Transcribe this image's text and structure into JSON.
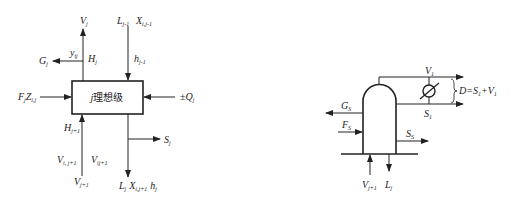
{
  "left_diagram": {
    "title": "j 理想级",
    "stage_var": "j",
    "stage_text": "理想级",
    "labels": {
      "vapor_out": {
        "main": "V",
        "sub": "j"
      },
      "vapor_enthalpy_out": {
        "main": "H",
        "sub": "j"
      },
      "vapor_side_draw": {
        "main": "G",
        "sub": "j"
      },
      "vapor_side_comp": {
        "main": "y",
        "sub": "ij"
      },
      "liquid_in": {
        "main": "L",
        "sub": "j-1"
      },
      "liquid_in_comp": {
        "main": "X",
        "sub": "i,j-1"
      },
      "liquid_in_enthalpy": {
        "main": "h",
        "sub": "j-1"
      },
      "feed": {
        "main": "F",
        "sub": "j",
        "main2": "Z",
        "sub2": "i,j"
      },
      "heat": {
        "prefix": "±",
        "main": "Q",
        "sub": "j"
      },
      "vapor_in_enthalpy": {
        "main": "H",
        "sub": "j+1"
      },
      "vapor_in_comp": {
        "main": "V",
        "sub": "i, j+1"
      },
      "vapor_in_comp2": {
        "main": "V",
        "sub": "ij+1"
      },
      "vapor_in": {
        "main": "V",
        "sub": "j+1"
      },
      "liquid_side_draw": {
        "main": "S",
        "sub": "j"
      },
      "liquid_out": {
        "main": "L",
        "sub": "j",
        "main2": "X",
        "sub2": "i,j+1",
        "main3": "h",
        "sub3": "j"
      }
    }
  },
  "right_diagram": {
    "labels": {
      "overhead_vapor": {
        "main": "V",
        "sub": "1"
      },
      "distillate_eq": {
        "text": "D=S",
        "sub": "1",
        "text2": "+V",
        "sub2": "1"
      },
      "reflux_draw": {
        "main": "S",
        "sub": "1"
      },
      "vapor_side": {
        "main": "G",
        "sub": "S"
      },
      "feed": {
        "main": "F",
        "sub": "S"
      },
      "liquid_side": {
        "main": "S",
        "sub": "S"
      },
      "vapor_in": {
        "main": "V",
        "sub": "j+1"
      },
      "liquid_out": {
        "main": "L",
        "sub": "j"
      }
    }
  },
  "colors": {
    "line": "#222222",
    "background": "#ffffff"
  }
}
